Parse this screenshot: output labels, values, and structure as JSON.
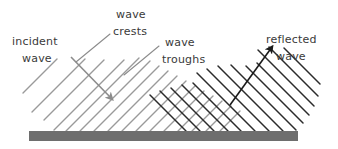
{
  "diagram": {
    "width": 338,
    "height": 149,
    "background_color": "#ffffff"
  },
  "labels": {
    "incident_line1": "incident",
    "incident_line2": "wave",
    "crests_line1": "wave",
    "crests_line2": "crests",
    "troughs_line1": "wave",
    "troughs_line2": "troughs",
    "reflected_line1": "reflected",
    "reflected_line2": "wave"
  },
  "colors": {
    "text": "#3a3a3a",
    "incident_wavefront": "#9a9a9a",
    "reflected_wavefront": "#2b2b2b",
    "incident_arrow": "#8c8c8c",
    "reflected_arrow": "#1a1a1a",
    "leader_line": "#8c8c8c",
    "barrier": "#6e6e6e",
    "background": "#ffffff"
  },
  "barrier": {
    "name": "reflecting-surface",
    "x": 29,
    "y": 131,
    "width": 269,
    "height": 10
  },
  "incident_arrow": {
    "name": "incident-direction-arrow",
    "x1": 72,
    "y1": 58,
    "x2": 113,
    "y2": 100,
    "angle_deg": -45
  },
  "reflected_arrow": {
    "name": "reflected-direction-arrow",
    "x1": 231,
    "y1": 104,
    "x2": 273,
    "y2": 47,
    "angle_deg": 45
  },
  "incident_wavefronts": {
    "orientation": "up-right-45",
    "count": 9,
    "spacing_px": 14,
    "color": "#9a9a9a"
  },
  "reflected_wavefronts": {
    "orientation": "down-right-45",
    "count": 9,
    "spacing_px": 14,
    "color": "#2b2b2b"
  },
  "leader_lines": [
    {
      "name": "crests-leader",
      "x1": 110,
      "y1": 33,
      "x2": 78,
      "y2": 60
    },
    {
      "name": "troughs-leader",
      "x1": 160,
      "y1": 45,
      "x2": 126,
      "y2": 74
    }
  ],
  "label_positions": {
    "incident": {
      "x": 12,
      "y": 45
    },
    "crests": {
      "x": 112,
      "y": 18
    },
    "troughs": {
      "x": 162,
      "y": 50
    },
    "reflected": {
      "x": 266,
      "y": 44
    }
  }
}
